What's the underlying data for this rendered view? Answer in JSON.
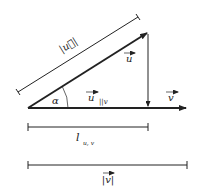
{
  "diagram": {
    "labels": {
      "u_magnitude": "|u⃗|",
      "u_vector": "u",
      "angle": "α",
      "u_parallel": "u",
      "u_parallel_sub": "||v",
      "v_vector": "v",
      "projection_length": "l",
      "projection_length_sub": "u, v",
      "v_magnitude": "|v|"
    },
    "colors": {
      "stroke": "#222222",
      "background": "#ffffff"
    }
  }
}
